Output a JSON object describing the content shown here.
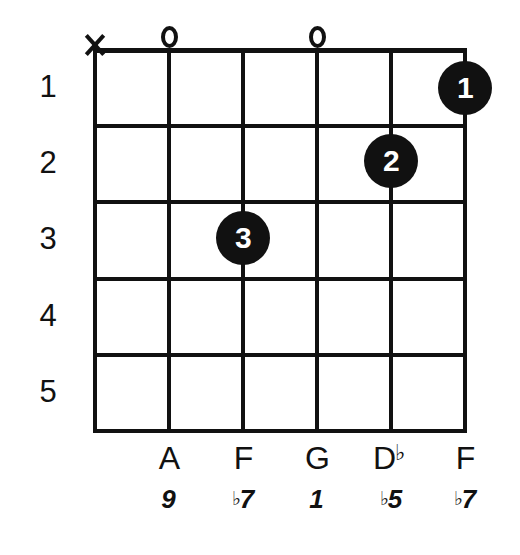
{
  "diagram": {
    "type": "guitar-chord-diagram",
    "string_count": 6,
    "fret_count": 5,
    "ink_color": "#111111",
    "background_color": "#ffffff",
    "fret_numbers": [
      "1",
      "2",
      "3",
      "4",
      "5"
    ],
    "strings": [
      {
        "index": 1,
        "top_marker": "X",
        "top_marker_type": "muted",
        "finger": null,
        "fret": null,
        "note": "",
        "interval": ""
      },
      {
        "index": 2,
        "top_marker": "O",
        "top_marker_type": "open",
        "finger": null,
        "fret": 0,
        "note": "A",
        "note_accidental": "",
        "interval": "9",
        "interval_accidental": ""
      },
      {
        "index": 3,
        "top_marker": "",
        "top_marker_type": "none",
        "finger": "3",
        "fret": 3,
        "note": "F",
        "note_accidental": "",
        "interval": "7",
        "interval_accidental": "♭"
      },
      {
        "index": 4,
        "top_marker": "O",
        "top_marker_type": "open",
        "finger": null,
        "fret": 0,
        "note": "G",
        "note_accidental": "",
        "interval": "1",
        "interval_accidental": ""
      },
      {
        "index": 5,
        "top_marker": "",
        "top_marker_type": "none",
        "finger": "2",
        "fret": 2,
        "note": "D",
        "note_accidental": "♭",
        "interval": "5",
        "interval_accidental": "♭"
      },
      {
        "index": 6,
        "top_marker": "",
        "top_marker_type": "none",
        "finger": "1",
        "fret": 1,
        "note": "F",
        "note_accidental": "",
        "interval": "7",
        "interval_accidental": "♭"
      }
    ]
  }
}
